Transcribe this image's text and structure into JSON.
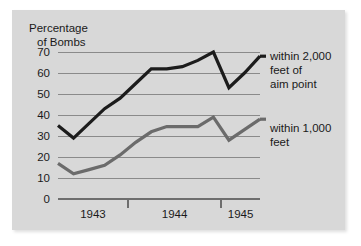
{
  "chart_data": {
    "type": "line",
    "title": "",
    "ylabel": "Percentage of Bombs",
    "ylabel_line1": "Percentage",
    "ylabel_line2": "of Bombs",
    "xlabel": "",
    "ylim": [
      0,
      70
    ],
    "yticks": [
      0,
      10,
      20,
      30,
      40,
      50,
      60,
      70
    ],
    "ytick_labels": [
      "0",
      "10",
      "20",
      "30",
      "40",
      "50",
      "60",
      "70"
    ],
    "grid": true,
    "legend_position": "right-inline",
    "xtick_labels": [
      "1943",
      "1944",
      "1945"
    ],
    "x_group_boundaries": [
      4.5,
      10.5
    ],
    "x": [
      0,
      1,
      2,
      3,
      4,
      5,
      6,
      7,
      8,
      9,
      10,
      11,
      12,
      13
    ],
    "xlim": [
      0,
      13
    ],
    "series": [
      {
        "name": "within 2,000 feet of aim point",
        "legend_line1": "within 2,000",
        "legend_line2": "feet of",
        "legend_line3": "aim point",
        "color": "#1c1c1c",
        "width": 3.2,
        "values": [
          35,
          29,
          36,
          43,
          48,
          55,
          62,
          62,
          63,
          66,
          70,
          53,
          60,
          68
        ]
      },
      {
        "name": "within 1,000 feet",
        "legend_line1": "within 1,000",
        "legend_line2": "feet",
        "color": "#6b6b6b",
        "width": 3.2,
        "values": [
          17,
          12,
          14,
          16,
          21,
          27,
          32,
          34.5,
          34.5,
          34.5,
          39,
          28,
          33,
          38
        ]
      }
    ]
  },
  "figure": {
    "background": "#ffffff",
    "panel_background": "#d8d8d8",
    "gridline_color": "#8a8a8a",
    "axis_color": "#6e6e6e"
  }
}
